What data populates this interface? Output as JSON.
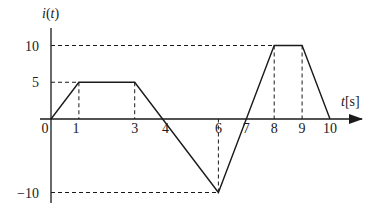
{
  "chart_data": {
    "type": "line",
    "title": "",
    "ylabel": "i(t)",
    "ylabel_func": "i",
    "ylabel_arg": "t",
    "xlabel": "t[s]",
    "xlabel_var": "t",
    "xlabel_unit": "[s]",
    "xlim": [
      0,
      11.2
    ],
    "ylim": [
      -12,
      13
    ],
    "grid": false,
    "legend": "none",
    "x_ticks": [
      {
        "value": 0,
        "label": "0"
      },
      {
        "value": 0.9,
        "label": "1"
      },
      {
        "value": 3,
        "label": "3"
      },
      {
        "value": 4.1,
        "label": "4"
      },
      {
        "value": 6,
        "label": "6"
      },
      {
        "value": 7,
        "label": "7"
      },
      {
        "value": 8,
        "label": "8"
      },
      {
        "value": 9,
        "label": "9"
      },
      {
        "value": 10,
        "label": "10"
      }
    ],
    "y_ticks": [
      {
        "value": 10,
        "label": "10"
      },
      {
        "value": 5,
        "label": "5"
      },
      {
        "value": -10,
        "label": "−10"
      }
    ],
    "series": [
      {
        "name": "i(t)",
        "points": [
          [
            0,
            0
          ],
          [
            1,
            5
          ],
          [
            3,
            5
          ],
          [
            4,
            0
          ],
          [
            6,
            -10
          ],
          [
            7,
            0
          ],
          [
            8,
            10
          ],
          [
            9,
            10
          ],
          [
            10,
            0
          ]
        ]
      }
    ],
    "guides": [
      {
        "kind": "h",
        "y": 10,
        "x_to": 8
      },
      {
        "kind": "h",
        "y": 5,
        "x_to": 1
      },
      {
        "kind": "h",
        "y": -10,
        "x_to": 6
      },
      {
        "kind": "v",
        "x": 1,
        "y_from": 5
      },
      {
        "kind": "v",
        "x": 3,
        "y_from": 5
      },
      {
        "kind": "v",
        "x": 6,
        "y_from": -10
      },
      {
        "kind": "v",
        "x": 8,
        "y_from": 10
      },
      {
        "kind": "v",
        "x": 9,
        "y_from": 10
      }
    ],
    "colors": {
      "line": "#1a1a1a",
      "guide": "#1a1a1a"
    }
  }
}
